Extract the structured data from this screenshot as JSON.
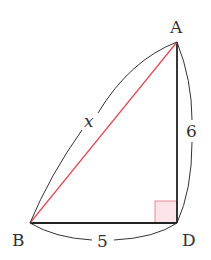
{
  "diagram": {
    "type": "right-triangle",
    "vertices": {
      "A": {
        "label": "A",
        "x": 177,
        "y": 42
      },
      "B": {
        "label": "B",
        "x": 30,
        "y": 223
      },
      "D": {
        "label": "D",
        "x": 177,
        "y": 223
      }
    },
    "sides": {
      "BD": {
        "label": "5"
      },
      "AD": {
        "label": "6"
      },
      "AB": {
        "label": "x",
        "color": "#e0505a"
      }
    },
    "right_angle_at": "D",
    "right_angle_fill": "#fbe3e8",
    "right_angle_stroke": "#e88a9a",
    "line_color": "#222222",
    "arc_color": "#333333"
  }
}
